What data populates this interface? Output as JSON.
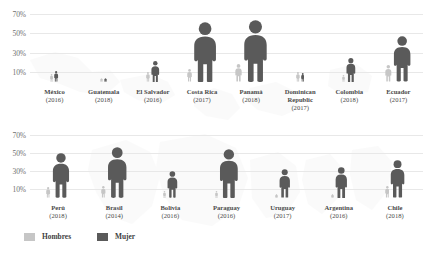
{
  "legend": {
    "items": [
      {
        "label": "Hombres",
        "color": "#c6c6c6",
        "name": "hombres"
      },
      {
        "label": "Mujer",
        "color": "#5a5a5a",
        "name": "mujer"
      }
    ]
  },
  "axis": {
    "ticks": [
      "70%",
      "50%",
      "30%",
      "10%"
    ],
    "tick_values": [
      70,
      50,
      30,
      10
    ]
  },
  "chart_data": {
    "type": "bar",
    "title": "",
    "subtitle": "",
    "xlabel": "",
    "ylabel": "",
    "ylim": [
      0,
      78
    ],
    "grid": true,
    "legend_position": "bottom-left",
    "pictogram": true,
    "rows": [
      {
        "name": "row-1",
        "categories": [
          "México",
          "Guatemala",
          "El Salvador",
          "Costa Rica",
          "Panamá",
          "Dominican Republic",
          "Colombia",
          "Ecuador"
        ],
        "years": [
          "(2016)",
          "(2018)",
          "(2016)",
          "(2017)",
          "(2018)",
          "(2017)",
          "(2018)",
          "(2017)"
        ],
        "series": [
          {
            "name": "Hombres",
            "color": "#c6c6c6",
            "values": [
              8,
              1,
              10,
              13,
              18,
              10,
              7,
              17
            ]
          },
          {
            "name": "Mujer",
            "color": "#5a5a5a",
            "values": [
              11,
              1,
              22,
              62,
              64,
              9,
              25,
              47
            ]
          }
        ]
      },
      {
        "name": "row-2",
        "categories": [
          "Perú",
          "Brasil",
          "Bolivia",
          "Paraguay",
          "Uruguay",
          "Argentina",
          "Chile"
        ],
        "years": [
          "(2018)",
          "(2014)",
          "(2016)",
          "(2016)",
          "(2017)",
          "(2016)",
          "(2018)"
        ],
        "series": [
          {
            "name": "Hombres",
            "color": "#c6c6c6",
            "values": [
              12,
              13,
              8,
              8,
              5,
              5,
              13
            ]
          },
          {
            "name": "Mujer",
            "color": "#5a5a5a",
            "values": [
              50,
              57,
              30,
              55,
              32,
              35,
              42
            ]
          }
        ]
      }
    ]
  }
}
